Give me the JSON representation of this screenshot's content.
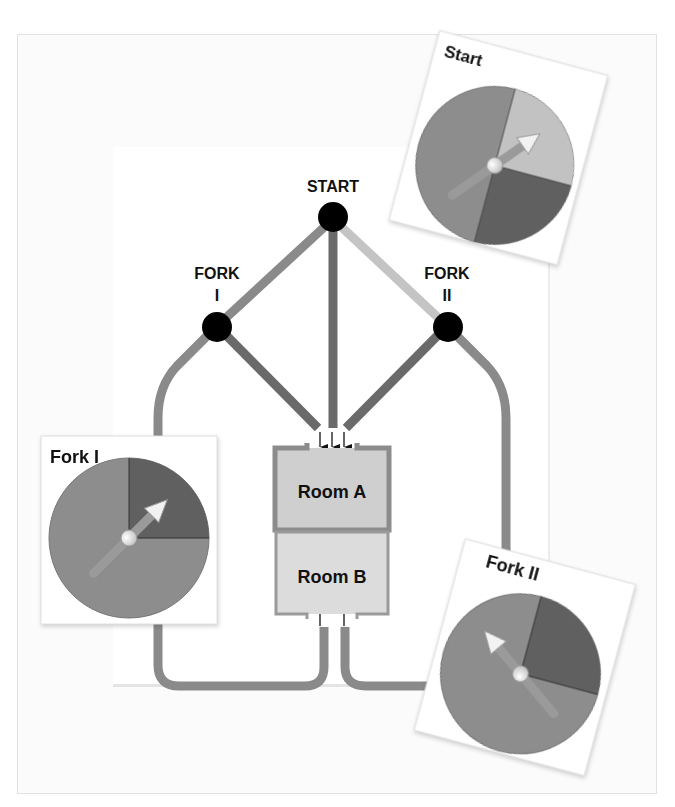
{
  "nodes": {
    "start": {
      "label": "START"
    },
    "fork1": {
      "label_line1": "FORK",
      "label_line2": "I"
    },
    "fork2": {
      "label_line1": "FORK",
      "label_line2": "II"
    }
  },
  "rooms": {
    "room_a": {
      "label": "Room A"
    },
    "room_b": {
      "label": "Room B"
    }
  },
  "spinners": {
    "start": {
      "title": "Start",
      "segments": [
        "medium",
        "light",
        "dark"
      ],
      "fractions": [
        0.5,
        0.25,
        0.25
      ],
      "pointer": "light"
    },
    "fork1": {
      "title": "Fork I",
      "segments": [
        "medium",
        "dark"
      ],
      "fractions": [
        0.75,
        0.25
      ],
      "pointer": "dark"
    },
    "fork2": {
      "title": "Fork II",
      "segments": [
        "medium",
        "dark"
      ],
      "fractions": [
        0.75,
        0.25
      ],
      "pointer": "medium"
    }
  },
  "colors": {
    "path_medium": "#8a8a8a",
    "path_dark": "#6a6a6a",
    "path_light": "#c4c4c4",
    "node": "#000000",
    "room_a_fill": "#cfcfcf",
    "room_b_fill": "#dcdcdc",
    "room_wall": "#8c8c8c",
    "spinner_medium": "#8d8d8d",
    "spinner_light": "#c2c2c2",
    "spinner_dark": "#606060"
  }
}
